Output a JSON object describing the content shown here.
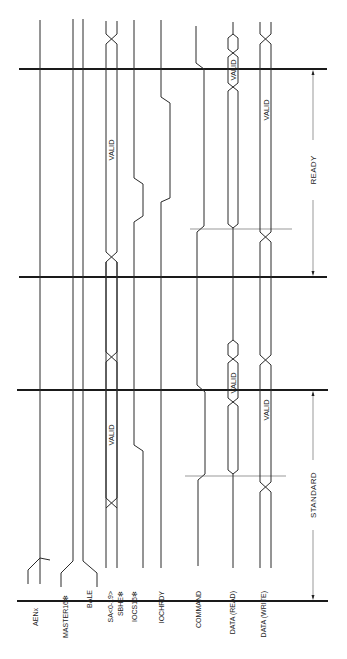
{
  "diagram": {
    "type": "timing-diagram",
    "orientation": "rotated-90-ccw",
    "signals": [
      {
        "id": "aen",
        "label": "AENx"
      },
      {
        "id": "master16",
        "label": "MASTER16✻"
      },
      {
        "id": "bale",
        "label": "BALE"
      },
      {
        "id": "sa",
        "label": "SA<0-19>"
      },
      {
        "id": "sbhe",
        "label": "SBHE✻"
      },
      {
        "id": "iocs16",
        "label": "IOCS16✻"
      },
      {
        "id": "iochrdy",
        "label": "IOCHRDY"
      },
      {
        "id": "command",
        "label": "COMMAND"
      },
      {
        "id": "data_read",
        "label": "DATA (READ)"
      },
      {
        "id": "data_write",
        "label": "DATA (WRITE)"
      }
    ],
    "valid_labels": {
      "address_ready": "VALID",
      "address_standard": "VALID",
      "read_ready": "VALID",
      "read_standard": "VALID",
      "write_ready": "VALID",
      "write_standard": "VALID"
    },
    "cycles": [
      {
        "name": "ready",
        "label": "READY"
      },
      {
        "name": "standard",
        "label": "STANDARD"
      }
    ]
  }
}
